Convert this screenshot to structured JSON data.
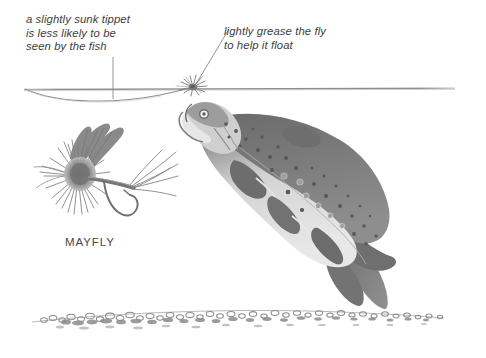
{
  "figure": {
    "background_color": "#ffffff",
    "ink_color": "#808080",
    "text_color": "#3d3d3d"
  },
  "annotations": [
    {
      "id": "tippet",
      "text": "a slightly sunk tippet\nis less likely to be\nseen by the fish",
      "style": "italic"
    },
    {
      "id": "grease",
      "text": "lightly grease the fly\nto help it float",
      "style": "italic"
    }
  ],
  "labels": [
    {
      "id": "mayfly",
      "text": "MAYFLY"
    }
  ],
  "scene": {
    "water_surface": "waterline",
    "riverbed": "gravel-bed",
    "fly_on_surface": "dry-fly",
    "fish": "leaping-brown-trout",
    "tippet": "sunk-tippet-line"
  }
}
